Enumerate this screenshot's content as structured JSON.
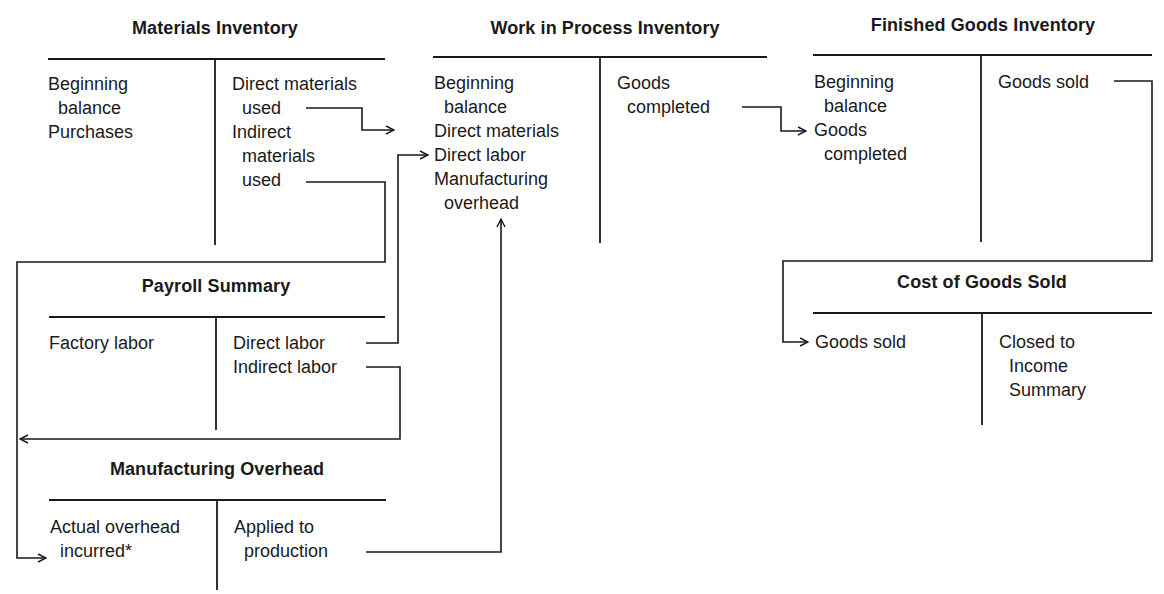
{
  "diagram": {
    "accounts": {
      "materials_inventory": {
        "title": "Materials Inventory",
        "debit": [
          "Beginning",
          "  balance",
          "Purchases"
        ],
        "credit": [
          "Direct materials",
          "  used",
          "Indirect",
          "  materials",
          "  used"
        ]
      },
      "work_in_process": {
        "title": "Work in Process Inventory",
        "debit": [
          "Beginning",
          "  balance",
          "Direct materials",
          "Direct labor",
          "Manufacturing",
          "  overhead"
        ],
        "credit": [
          "Goods",
          "  completed"
        ]
      },
      "finished_goods": {
        "title": "Finished Goods Inventory",
        "debit": [
          "Beginning",
          "  balance",
          "Goods",
          "  completed"
        ],
        "credit": [
          "Goods sold"
        ]
      },
      "payroll_summary": {
        "title": "Payroll Summary",
        "debit": [
          "Factory labor"
        ],
        "credit": [
          "Direct labor",
          "Indirect labor"
        ]
      },
      "manufacturing_overhead": {
        "title": "Manufacturing Overhead",
        "debit": [
          "Actual overhead",
          "  incurred*"
        ],
        "credit": [
          "Applied to",
          "  production"
        ]
      },
      "cost_of_goods_sold": {
        "title": "Cost of Goods Sold",
        "debit": [
          "Goods sold"
        ],
        "credit": [
          "Closed to",
          "  Income",
          "  Summary"
        ]
      }
    },
    "flows": [
      {
        "from": "Materials Inventory: Direct materials used",
        "to": "Work in Process Inventory: Direct materials"
      },
      {
        "from": "Materials Inventory: Indirect materials used",
        "to": "Manufacturing Overhead: Actual overhead incurred"
      },
      {
        "from": "Payroll Summary: Direct labor",
        "to": "Work in Process Inventory: Direct labor"
      },
      {
        "from": "Payroll Summary: Indirect labor",
        "to": "Manufacturing Overhead: Actual overhead incurred"
      },
      {
        "from": "Manufacturing Overhead: Applied to production",
        "to": "Work in Process Inventory: Manufacturing overhead"
      },
      {
        "from": "Work in Process Inventory: Goods completed",
        "to": "Finished Goods Inventory: Goods completed"
      },
      {
        "from": "Finished Goods Inventory: Goods sold",
        "to": "Cost of Goods Sold: Goods sold"
      }
    ],
    "colors": {
      "ink": "#1a1a1a",
      "background": "#ffffff"
    }
  }
}
